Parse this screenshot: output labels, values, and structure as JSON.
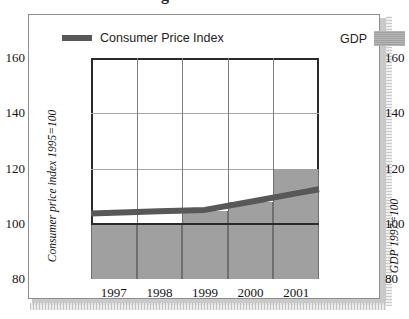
{
  "page": {
    "clipped_heading": "Bestimmt uns Nahrung ausreichen?"
  },
  "figure": {
    "legend": {
      "series_line": {
        "label": "Consumer Price Index",
        "color": "#585858",
        "marker": "thick-line-swatch"
      },
      "series_bar": {
        "label": "GDP",
        "color": "#a0a0a0",
        "marker": "filled-box-swatch"
      }
    },
    "axis_titles": {
      "left": "Consumer price index 1995=100",
      "right": "GDP 1997=100"
    }
  },
  "chart_data": {
    "type": "bar",
    "title": "",
    "subtitle": "",
    "xlabel": "",
    "ylabel": "Consumer price index 1995=100",
    "ylabel_right": "GDP 1997=100",
    "categories": [
      "1997",
      "1998",
      "1999",
      "2000",
      "2001"
    ],
    "x_tick_labels": [
      "1997",
      "1998",
      "1999",
      "2000",
      "2001"
    ],
    "y_tick_labels_left": [
      "160",
      "140",
      "120",
      "100",
      "80"
    ],
    "y_tick_labels_right": [
      "160",
      "140",
      "120",
      "100",
      "80"
    ],
    "ylim": [
      80,
      160
    ],
    "ylim_right": [
      80,
      160
    ],
    "y_ticks": [
      80,
      100,
      120,
      140,
      160
    ],
    "grid": true,
    "grid_axis": "both",
    "legend_position": "top",
    "series": [
      {
        "name": "GDP",
        "type": "bar",
        "axis": "right",
        "color": "#a0a0a0",
        "categories": [
          "1997",
          "1998",
          "1999",
          "2000",
          "2001"
        ],
        "values": [
          100,
          100,
          104.5,
          108,
          120
        ]
      },
      {
        "name": "Consumer Price Index",
        "type": "line",
        "axis": "left",
        "color": "#585858",
        "categories": [
          "1997",
          "1998",
          "1999",
          "2000",
          "2001"
        ],
        "values": [
          104,
          104.5,
          105,
          108,
          111
        ]
      }
    ],
    "annotations": []
  }
}
